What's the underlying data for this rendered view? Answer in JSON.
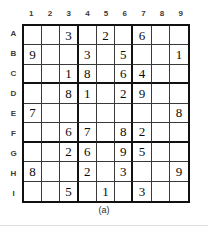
{
  "figure": {
    "caption": "(a)",
    "type": "sudoku-puzzle-grid",
    "colors": {
      "background": "#ffffff",
      "thick_border": "#111111",
      "thin_border": "#3a3a3a",
      "digit": "#0a0a0a",
      "header_label": "#3b3b3b"
    }
  },
  "grid": {
    "column_headers": [
      "1",
      "2",
      "3",
      "4",
      "5",
      "6",
      "7",
      "8",
      "9"
    ],
    "row_headers": [
      "A",
      "B",
      "C",
      "D",
      "E",
      "F",
      "G",
      "H",
      "I"
    ],
    "size": 9,
    "box_size": 3,
    "rows": [
      [
        "",
        "",
        "3",
        "",
        "2",
        "",
        "6",
        "",
        ""
      ],
      [
        "9",
        "",
        "",
        "3",
        "",
        "5",
        "",
        "",
        "1"
      ],
      [
        "",
        "",
        "1",
        "8",
        "",
        "6",
        "4",
        "",
        ""
      ],
      [
        "",
        "",
        "8",
        "1",
        "",
        "2",
        "9",
        "",
        ""
      ],
      [
        "7",
        "",
        "",
        "",
        "",
        "",
        "",
        "",
        "8"
      ],
      [
        "",
        "",
        "6",
        "7",
        "",
        "8",
        "2",
        "",
        ""
      ],
      [
        "",
        "",
        "2",
        "6",
        "",
        "9",
        "5",
        "",
        ""
      ],
      [
        "8",
        "",
        "",
        "2",
        "",
        "3",
        "",
        "",
        "9"
      ],
      [
        "",
        "",
        "5",
        "",
        "1",
        "",
        "3",
        "",
        ""
      ]
    ],
    "given_clues": [
      {
        "cell": "A3",
        "value": "3"
      },
      {
        "cell": "A5",
        "value": "2"
      },
      {
        "cell": "A7",
        "value": "6"
      },
      {
        "cell": "B1",
        "value": "9"
      },
      {
        "cell": "B4",
        "value": "3"
      },
      {
        "cell": "B6",
        "value": "5"
      },
      {
        "cell": "B9",
        "value": "1"
      },
      {
        "cell": "C3",
        "value": "1"
      },
      {
        "cell": "C4",
        "value": "8"
      },
      {
        "cell": "C6",
        "value": "6"
      },
      {
        "cell": "C7",
        "value": "4"
      },
      {
        "cell": "D3",
        "value": "8"
      },
      {
        "cell": "D4",
        "value": "1"
      },
      {
        "cell": "D6",
        "value": "2"
      },
      {
        "cell": "D7",
        "value": "9"
      },
      {
        "cell": "E1",
        "value": "7"
      },
      {
        "cell": "E9",
        "value": "8"
      },
      {
        "cell": "F3",
        "value": "6"
      },
      {
        "cell": "F4",
        "value": "7"
      },
      {
        "cell": "F6",
        "value": "8"
      },
      {
        "cell": "F7",
        "value": "2"
      },
      {
        "cell": "G3",
        "value": "2"
      },
      {
        "cell": "G4",
        "value": "6"
      },
      {
        "cell": "G6",
        "value": "9"
      },
      {
        "cell": "G7",
        "value": "5"
      },
      {
        "cell": "H1",
        "value": "8"
      },
      {
        "cell": "H4",
        "value": "2"
      },
      {
        "cell": "H6",
        "value": "3"
      },
      {
        "cell": "H9",
        "value": "9"
      },
      {
        "cell": "I3",
        "value": "5"
      },
      {
        "cell": "I5",
        "value": "1"
      },
      {
        "cell": "I7",
        "value": "3"
      }
    ]
  }
}
